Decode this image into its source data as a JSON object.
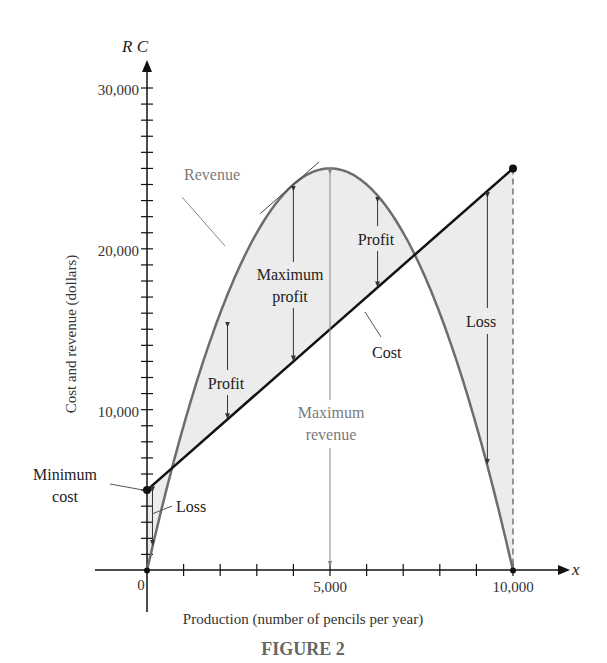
{
  "header": {
    "cropped_top_text": ""
  },
  "chart_data": {
    "type": "line",
    "title": "FIGURE 2",
    "xlabel": "Production (number of pencils per year)",
    "ylabel": "Cost and revenue (dollars)",
    "x_axis_symbol": "x",
    "y_axis_symbol": "R C",
    "xlim": [
      0,
      10000
    ],
    "ylim": [
      0,
      30000
    ],
    "x_ticks": [
      0,
      1000,
      2000,
      3000,
      4000,
      5000,
      6000,
      7000,
      8000,
      9000,
      10000
    ],
    "x_tick_labels": [
      "0",
      "5,000",
      "10,000"
    ],
    "x_tick_label_values": [
      0,
      5000,
      10000
    ],
    "y_tick_labels": [
      "10,000",
      "20,000",
      "30,000"
    ],
    "y_tick_label_values": [
      10000,
      20000,
      30000
    ],
    "y_minor_tick_step": 1000,
    "grid": false,
    "series": [
      {
        "name": "Revenue",
        "formula": "R = 10x - 0.001x^2",
        "x": [
          0,
          1000,
          2000,
          3000,
          4000,
          5000,
          6000,
          7000,
          8000,
          9000,
          10000
        ],
        "values": [
          0,
          9000,
          16000,
          21000,
          24000,
          25000,
          24000,
          21000,
          16000,
          9000,
          0
        ],
        "color": "#6d6d6d"
      },
      {
        "name": "Cost",
        "formula": "C = 5000 + 2x",
        "x": [
          0,
          10000
        ],
        "values": [
          5000,
          25000
        ],
        "color": "#111111"
      }
    ],
    "annotations": [
      {
        "text": "Revenue",
        "x": 1900,
        "y": 26200
      },
      {
        "text": "Cost",
        "x": 6200,
        "y": 13500
      },
      {
        "text": "Maximum profit",
        "x": 4000,
        "y": 19000
      },
      {
        "text": "Profit",
        "x": 6200,
        "y": 21500
      },
      {
        "text": "Profit",
        "x": 2200,
        "y": 12200
      },
      {
        "text": "Maximum revenue",
        "x": 5000,
        "y": 9500
      },
      {
        "text": "Loss",
        "x": 9200,
        "y": 16500
      },
      {
        "text": "Minimum cost",
        "x": -1500,
        "y": 5000
      },
      {
        "text": "Loss",
        "x": 1300,
        "y": 3100
      }
    ],
    "key_points": {
      "minimum_cost": [
        0,
        5000
      ],
      "maximum_revenue": [
        5000,
        25000
      ],
      "maximum_profit_x": 4000,
      "break_even_x": [
        677,
        7323
      ],
      "end_point": [
        10000,
        25000
      ]
    }
  },
  "labels": {
    "y_axis_symbol": "R C",
    "x_axis_symbol": "x",
    "y30": "30,000",
    "y20": "20,000",
    "y10": "10,000",
    "x0": "0",
    "x5": "5,000",
    "x10": "10,000",
    "xlabel": "Production (number of pencils per year)",
    "ylabel": "Cost and revenue (dollars)",
    "revenue": "Revenue",
    "cost": "Cost",
    "max_profit_1": "Maximum",
    "max_profit_2": "profit",
    "profit_right": "Profit",
    "profit_left": "Profit",
    "max_revenue_1": "Maximum",
    "max_revenue_2": "revenue",
    "loss_right": "Loss",
    "min_cost_1": "Minimum",
    "min_cost_2": "cost",
    "loss_left": "Loss",
    "caption": "FIGURE 2"
  },
  "colors": {
    "revenue": "#6d6d6d",
    "cost": "#111111",
    "shade": "#ececec",
    "gray_text": "#7a7a7a",
    "caption": "#666666"
  }
}
